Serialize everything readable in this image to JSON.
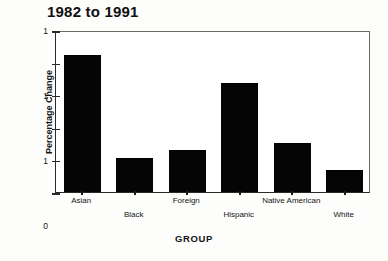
{
  "chart_data": {
    "type": "bar",
    "title": "1982 to 1991",
    "xlabel": "GROUP",
    "ylabel": "Percentage Change",
    "categories": [
      "Asian",
      "Black",
      "Foreign",
      "Hispanic",
      "Native American",
      "White"
    ],
    "values": [
      1.26,
      0.31,
      0.38,
      1.0,
      0.44,
      0.19
    ],
    "ylim": [
      0,
      1.5
    ],
    "ytick_labels": [
      "1",
      "1",
      "1",
      "0",
      "0",
      "0"
    ],
    "ytick_values": [
      1.5,
      1.2,
      0.9,
      0.6,
      0.3,
      0
    ],
    "grid": false,
    "legend": false,
    "bar_color": "#050505",
    "axis_color": "#2a2a2a",
    "background": "#ffffff"
  },
  "axis": {
    "top_tick_label": "1"
  }
}
